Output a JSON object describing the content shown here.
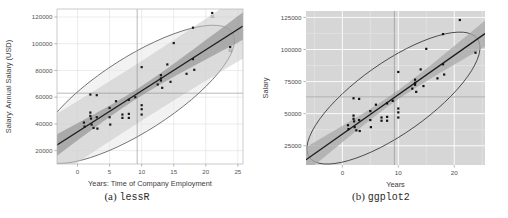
{
  "figure": {
    "subfigures": [
      {
        "index": "(a)",
        "name": "lessR"
      },
      {
        "index": "(b)",
        "name": "ggplot2"
      }
    ]
  },
  "chart_data": [
    {
      "type": "scatter",
      "panel": "a",
      "title": "",
      "xlabel": "Years: Time of Company Employment",
      "ylabel": "Salary: Annual Salary (USD)",
      "xlim": [
        -3.2,
        25.8
      ],
      "ylim": [
        10000,
        126000
      ],
      "xticks": [
        0,
        5,
        10,
        15,
        20,
        25
      ],
      "xtick_labels": [
        "0",
        "5",
        "10",
        "15",
        "20",
        "25"
      ],
      "yticks": [
        20000,
        40000,
        60000,
        80000,
        100000,
        120000
      ],
      "ytick_labels": [
        "20000",
        "40000",
        "60000",
        "80000",
        "100000",
        "120000"
      ],
      "grid": true,
      "grid_color": "#d8d8d8",
      "panel_background": "#ffffff",
      "point_color": "#1a1a1a",
      "point_marker": "square",
      "fit_line_color": "#1c1c1c",
      "confidence_band_color": "#9a9a9a",
      "prediction_band_color": "#c9c9c9",
      "ellipse_color": "#5a5a5a",
      "ellipse_fill": "#e8e8e8",
      "mean_line_color": "#8a8a8a",
      "mean_x": 9.3,
      "mean_y": 63000,
      "point_labels": [
        {
          "label": "16",
          "x": 21.0,
          "y": 123000
        },
        {
          "label": "34",
          "x": 23.8,
          "y": 97500
        }
      ],
      "points": [
        {
          "x": 1.0,
          "y": 41000
        },
        {
          "x": 1.1,
          "y": 38000
        },
        {
          "x": 2.0,
          "y": 62000
        },
        {
          "x": 2.0,
          "y": 48500
        },
        {
          "x": 2.0,
          "y": 46000
        },
        {
          "x": 2.1,
          "y": 44000
        },
        {
          "x": 2.2,
          "y": 39500
        },
        {
          "x": 2.5,
          "y": 37000
        },
        {
          "x": 3.0,
          "y": 61500
        },
        {
          "x": 3.0,
          "y": 45000
        },
        {
          "x": 3.1,
          "y": 36500
        },
        {
          "x": 5.0,
          "y": 52000
        },
        {
          "x": 5.0,
          "y": 45000
        },
        {
          "x": 5.1,
          "y": 39500
        },
        {
          "x": 6.0,
          "y": 57000
        },
        {
          "x": 7.0,
          "y": 47000
        },
        {
          "x": 7.0,
          "y": 44500
        },
        {
          "x": 8.0,
          "y": 58000
        },
        {
          "x": 8.0,
          "y": 47500
        },
        {
          "x": 8.0,
          "y": 44500
        },
        {
          "x": 9.0,
          "y": 60000
        },
        {
          "x": 10.0,
          "y": 82500
        },
        {
          "x": 10.0,
          "y": 54000
        },
        {
          "x": 10.0,
          "y": 51000
        },
        {
          "x": 10.0,
          "y": 47000
        },
        {
          "x": 12.5,
          "y": 69500
        },
        {
          "x": 13.0,
          "y": 76500
        },
        {
          "x": 13.0,
          "y": 74000
        },
        {
          "x": 13.0,
          "y": 72500
        },
        {
          "x": 13.2,
          "y": 67000
        },
        {
          "x": 14.0,
          "y": 84500
        },
        {
          "x": 14.5,
          "y": 71500
        },
        {
          "x": 15.0,
          "y": 100500
        },
        {
          "x": 17.0,
          "y": 77500
        },
        {
          "x": 18.0,
          "y": 112000
        },
        {
          "x": 18.0,
          "y": 88500
        },
        {
          "x": 18.2,
          "y": 80500
        },
        {
          "x": 21.0,
          "y": 123000
        },
        {
          "x": 23.8,
          "y": 97500
        }
      ]
    },
    {
      "type": "scatter",
      "panel": "b",
      "title": "",
      "xlabel": "Years",
      "ylabel": "Salary",
      "xlim": [
        -6.5,
        25.5
      ],
      "ylim": [
        10000,
        130000
      ],
      "xticks": [
        0,
        10,
        20
      ],
      "xtick_labels": [
        "0",
        "10",
        "20"
      ],
      "yticks": [
        25000,
        50000,
        75000,
        100000,
        125000
      ],
      "ytick_labels": [
        "25000",
        "50000",
        "75000",
        "100000",
        "125000"
      ],
      "grid": true,
      "grid_color": "#ffffff",
      "panel_background": "#d6d6d6",
      "point_color": "#111111",
      "point_marker": "square",
      "fit_line_color": "#1c1c1c",
      "confidence_band_color": "#a8a8a8",
      "ellipse_color": "#2e2e2e",
      "mean_line_color": "#8c8c8c",
      "mean_x": 9.3,
      "mean_y": 63000,
      "points": [
        {
          "x": 1.0,
          "y": 41000
        },
        {
          "x": 1.1,
          "y": 38000
        },
        {
          "x": 2.0,
          "y": 62000
        },
        {
          "x": 2.0,
          "y": 48500
        },
        {
          "x": 2.0,
          "y": 46000
        },
        {
          "x": 2.1,
          "y": 44000
        },
        {
          "x": 2.2,
          "y": 39500
        },
        {
          "x": 2.5,
          "y": 37000
        },
        {
          "x": 3.0,
          "y": 61500
        },
        {
          "x": 3.0,
          "y": 45000
        },
        {
          "x": 3.1,
          "y": 36500
        },
        {
          "x": 5.0,
          "y": 52000
        },
        {
          "x": 5.0,
          "y": 45000
        },
        {
          "x": 5.1,
          "y": 39500
        },
        {
          "x": 6.0,
          "y": 57000
        },
        {
          "x": 7.0,
          "y": 47000
        },
        {
          "x": 7.0,
          "y": 44500
        },
        {
          "x": 8.0,
          "y": 58000
        },
        {
          "x": 8.0,
          "y": 47500
        },
        {
          "x": 8.0,
          "y": 44500
        },
        {
          "x": 9.0,
          "y": 60000
        },
        {
          "x": 10.0,
          "y": 82500
        },
        {
          "x": 10.0,
          "y": 54000
        },
        {
          "x": 10.0,
          "y": 51000
        },
        {
          "x": 10.0,
          "y": 47000
        },
        {
          "x": 12.5,
          "y": 69500
        },
        {
          "x": 13.0,
          "y": 76500
        },
        {
          "x": 13.0,
          "y": 74000
        },
        {
          "x": 13.0,
          "y": 72500
        },
        {
          "x": 13.2,
          "y": 67000
        },
        {
          "x": 14.0,
          "y": 84500
        },
        {
          "x": 14.5,
          "y": 71500
        },
        {
          "x": 15.0,
          "y": 100500
        },
        {
          "x": 17.0,
          "y": 77500
        },
        {
          "x": 18.0,
          "y": 112000
        },
        {
          "x": 18.0,
          "y": 88500
        },
        {
          "x": 18.2,
          "y": 80500
        },
        {
          "x": 21.0,
          "y": 123000
        },
        {
          "x": 23.8,
          "y": 97500
        }
      ]
    }
  ]
}
